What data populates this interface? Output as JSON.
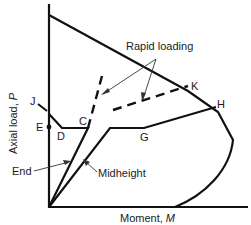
{
  "diagram": {
    "type": "interaction-diagram",
    "axes": {
      "y_label_text": "Axial load, ",
      "y_label_var": "P",
      "x_label_text": "Moment, ",
      "x_label_var": "M"
    },
    "points": {
      "J": "J",
      "E": "E",
      "D": "D",
      "C": "C",
      "G": "G",
      "K": "K",
      "H": "H"
    },
    "annotations": {
      "rapid_loading": "Rapid loading",
      "end": "End",
      "midheight": "Midheight"
    },
    "colors": {
      "line": "#111111",
      "arrow": "#333333"
    }
  }
}
